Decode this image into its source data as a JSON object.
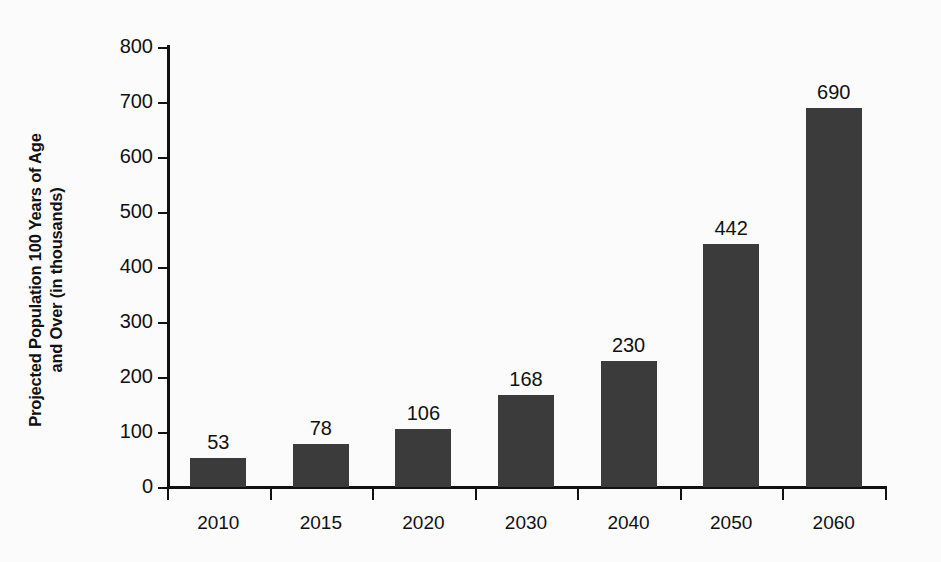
{
  "chart_data": {
    "type": "bar",
    "title": "",
    "subtitle": "",
    "xlabel": "",
    "ylabel_lines": [
      "Projected Population 100 Years of Age",
      "and Over (in thousands)"
    ],
    "ylabel": "Projected Population 100 Years of Age and Over (in thousands)",
    "categories": [
      "2010",
      "2015",
      "2020",
      "2030",
      "2040",
      "2050",
      "2060"
    ],
    "values": [
      53,
      78,
      106,
      168,
      230,
      442,
      690
    ],
    "value_labels": [
      "53",
      "78",
      "106",
      "168",
      "230",
      "442",
      "690"
    ],
    "ylim": [
      0,
      800
    ],
    "ytick_values": [
      0,
      100,
      200,
      300,
      400,
      500,
      600,
      700,
      800
    ],
    "ytick_labels": [
      "0",
      "100",
      "200",
      "300",
      "400",
      "500",
      "600",
      "700",
      "800"
    ],
    "grid": false,
    "legend": false,
    "legend_position": "none",
    "bar_color": "#3b3b3b",
    "axis_color": "#111111",
    "background_color": "#fbfbfb",
    "text_color": "#111111"
  }
}
